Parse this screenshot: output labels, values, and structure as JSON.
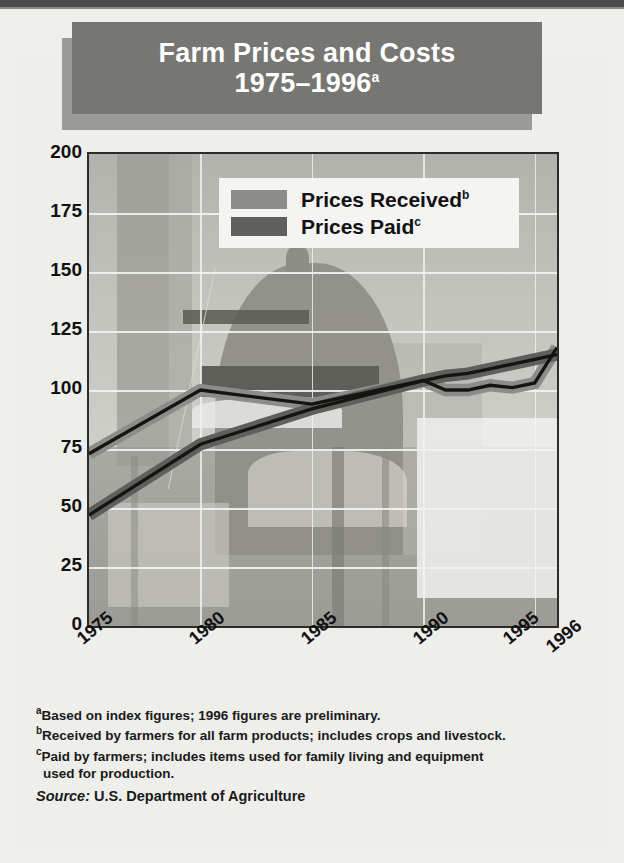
{
  "title": {
    "line1": "Farm Prices and Costs",
    "line2": "1975–1996",
    "line2_sup": "a"
  },
  "legend": {
    "items": [
      {
        "label": "Prices Received",
        "sup": "b",
        "color": "#8c8c88"
      },
      {
        "label": "Prices Paid",
        "sup": "c",
        "color": "#5f5f5b"
      }
    ]
  },
  "notes": {
    "a_sup": "a",
    "a": "Based on index figures; 1996 figures are preliminary.",
    "b_sup": "b",
    "b": "Received by farmers for all farm products; includes crops and livestock.",
    "c_sup": "c",
    "c": "Paid by farmers; includes items used for family living and equipment",
    "c_cont": "used for production.",
    "source_label": "Source:",
    "source_value": "U.S. Department of Agriculture"
  },
  "chart_data": {
    "type": "line",
    "title": "Farm Prices and Costs 1975–1996",
    "xlabel": "",
    "ylabel": "",
    "ylim": [
      0,
      200
    ],
    "xlim": [
      1975,
      1996
    ],
    "yticks": [
      200,
      175,
      150,
      125,
      100,
      75,
      50,
      25,
      0
    ],
    "xticks": [
      1975,
      1980,
      1985,
      1990,
      1995,
      1996
    ],
    "grid": true,
    "legend_position": "top-left-inside",
    "x": [
      1975,
      1980,
      1985,
      1990,
      1991,
      1992,
      1993,
      1994,
      1995,
      1996
    ],
    "series": [
      {
        "name": "Prices Received",
        "color": "#8c8c88",
        "values": [
          73,
          100,
          94,
          104,
          100,
          100,
          102,
          101,
          103,
          118
        ]
      },
      {
        "name": "Prices Paid",
        "color": "#5f5f5b",
        "values": [
          47,
          77,
          92,
          104,
          106,
          107,
          109,
          111,
          113,
          115
        ]
      }
    ]
  }
}
